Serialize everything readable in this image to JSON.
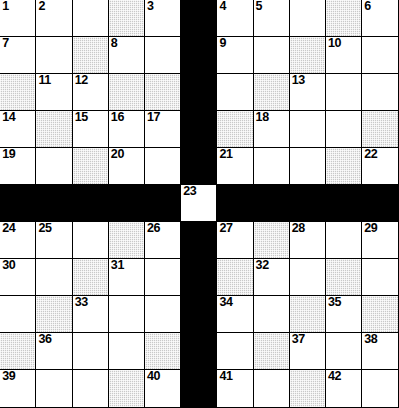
{
  "puzzle": {
    "title": "Crossword Grid",
    "type": "crossword",
    "columns": 11,
    "rows": 11,
    "colors": {
      "cell_fill": "#ffffff",
      "shaded_fill": "#c9c9c9",
      "block_fill": "#000000",
      "border": "#000000",
      "number_text": "#000000"
    },
    "structure_note": "Four 5x5 quadrants separated by a solid black cross; a single white numbered cell sits at the centre of the cross.",
    "legend": {
      "white": "open answer square",
      "shaded": "shaded answer square",
      "black": "blocked square"
    },
    "cells": [
      [
        {
          "state": "open",
          "number": "1"
        },
        {
          "state": "open",
          "number": "2"
        },
        {
          "state": "open",
          "number": ""
        },
        {
          "state": "shaded",
          "number": ""
        },
        {
          "state": "open",
          "number": "3"
        },
        {
          "state": "block",
          "number": ""
        },
        {
          "state": "open",
          "number": "4"
        },
        {
          "state": "open",
          "number": "5"
        },
        {
          "state": "open",
          "number": ""
        },
        {
          "state": "shaded",
          "number": ""
        },
        {
          "state": "open",
          "number": "6"
        }
      ],
      [
        {
          "state": "open",
          "number": "7"
        },
        {
          "state": "open",
          "number": ""
        },
        {
          "state": "shaded",
          "number": ""
        },
        {
          "state": "open",
          "number": "8"
        },
        {
          "state": "open",
          "number": ""
        },
        {
          "state": "block",
          "number": ""
        },
        {
          "state": "open",
          "number": "9"
        },
        {
          "state": "open",
          "number": ""
        },
        {
          "state": "shaded",
          "number": ""
        },
        {
          "state": "open",
          "number": "10"
        },
        {
          "state": "open",
          "number": ""
        }
      ],
      [
        {
          "state": "shaded",
          "number": ""
        },
        {
          "state": "open",
          "number": "11"
        },
        {
          "state": "open",
          "number": "12"
        },
        {
          "state": "shaded",
          "number": ""
        },
        {
          "state": "shaded",
          "number": ""
        },
        {
          "state": "block",
          "number": ""
        },
        {
          "state": "open",
          "number": ""
        },
        {
          "state": "shaded",
          "number": ""
        },
        {
          "state": "open",
          "number": "13"
        },
        {
          "state": "open",
          "number": ""
        },
        {
          "state": "open",
          "number": ""
        }
      ],
      [
        {
          "state": "open",
          "number": "14"
        },
        {
          "state": "shaded",
          "number": ""
        },
        {
          "state": "open",
          "number": "15"
        },
        {
          "state": "open",
          "number": "16"
        },
        {
          "state": "open",
          "number": "17"
        },
        {
          "state": "block",
          "number": ""
        },
        {
          "state": "shaded",
          "number": ""
        },
        {
          "state": "open",
          "number": "18"
        },
        {
          "state": "open",
          "number": ""
        },
        {
          "state": "open",
          "number": ""
        },
        {
          "state": "shaded",
          "number": ""
        }
      ],
      [
        {
          "state": "open",
          "number": "19"
        },
        {
          "state": "open",
          "number": ""
        },
        {
          "state": "shaded",
          "number": ""
        },
        {
          "state": "open",
          "number": "20"
        },
        {
          "state": "open",
          "number": ""
        },
        {
          "state": "block",
          "number": ""
        },
        {
          "state": "open",
          "number": "21"
        },
        {
          "state": "open",
          "number": ""
        },
        {
          "state": "open",
          "number": ""
        },
        {
          "state": "shaded",
          "number": ""
        },
        {
          "state": "open",
          "number": "22"
        }
      ],
      [
        {
          "state": "block",
          "number": ""
        },
        {
          "state": "block",
          "number": ""
        },
        {
          "state": "block",
          "number": ""
        },
        {
          "state": "block",
          "number": ""
        },
        {
          "state": "block",
          "number": ""
        },
        {
          "state": "open",
          "number": "23"
        },
        {
          "state": "block",
          "number": ""
        },
        {
          "state": "block",
          "number": ""
        },
        {
          "state": "block",
          "number": ""
        },
        {
          "state": "block",
          "number": ""
        },
        {
          "state": "block",
          "number": ""
        }
      ],
      [
        {
          "state": "open",
          "number": "24"
        },
        {
          "state": "open",
          "number": "25"
        },
        {
          "state": "open",
          "number": ""
        },
        {
          "state": "shaded",
          "number": ""
        },
        {
          "state": "open",
          "number": "26"
        },
        {
          "state": "block",
          "number": ""
        },
        {
          "state": "open",
          "number": "27"
        },
        {
          "state": "shaded",
          "number": ""
        },
        {
          "state": "open",
          "number": "28"
        },
        {
          "state": "open",
          "number": ""
        },
        {
          "state": "open",
          "number": "29"
        }
      ],
      [
        {
          "state": "open",
          "number": "30"
        },
        {
          "state": "open",
          "number": ""
        },
        {
          "state": "shaded",
          "number": ""
        },
        {
          "state": "open",
          "number": "31"
        },
        {
          "state": "open",
          "number": ""
        },
        {
          "state": "block",
          "number": ""
        },
        {
          "state": "shaded",
          "number": ""
        },
        {
          "state": "open",
          "number": "32"
        },
        {
          "state": "open",
          "number": ""
        },
        {
          "state": "shaded",
          "number": ""
        },
        {
          "state": "open",
          "number": ""
        }
      ],
      [
        {
          "state": "open",
          "number": ""
        },
        {
          "state": "shaded",
          "number": ""
        },
        {
          "state": "open",
          "number": "33"
        },
        {
          "state": "open",
          "number": ""
        },
        {
          "state": "open",
          "number": ""
        },
        {
          "state": "block",
          "number": ""
        },
        {
          "state": "open",
          "number": "34"
        },
        {
          "state": "open",
          "number": ""
        },
        {
          "state": "shaded",
          "number": ""
        },
        {
          "state": "open",
          "number": "35"
        },
        {
          "state": "shaded",
          "number": ""
        }
      ],
      [
        {
          "state": "shaded",
          "number": ""
        },
        {
          "state": "open",
          "number": "36"
        },
        {
          "state": "open",
          "number": ""
        },
        {
          "state": "open",
          "number": ""
        },
        {
          "state": "shaded",
          "number": ""
        },
        {
          "state": "block",
          "number": ""
        },
        {
          "state": "open",
          "number": ""
        },
        {
          "state": "shaded",
          "number": ""
        },
        {
          "state": "open",
          "number": "37"
        },
        {
          "state": "open",
          "number": ""
        },
        {
          "state": "open",
          "number": "38"
        }
      ],
      [
        {
          "state": "open",
          "number": "39"
        },
        {
          "state": "open",
          "number": ""
        },
        {
          "state": "open",
          "number": ""
        },
        {
          "state": "shaded",
          "number": ""
        },
        {
          "state": "open",
          "number": "40"
        },
        {
          "state": "block",
          "number": ""
        },
        {
          "state": "open",
          "number": "41"
        },
        {
          "state": "open",
          "number": ""
        },
        {
          "state": "shaded",
          "number": ""
        },
        {
          "state": "open",
          "number": "42"
        },
        {
          "state": "open",
          "number": ""
        }
      ]
    ]
  }
}
